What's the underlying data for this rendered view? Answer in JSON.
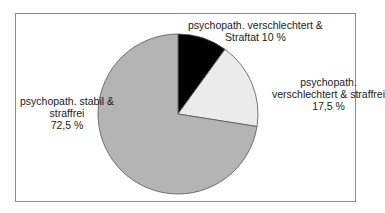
{
  "chart_data": {
    "type": "pie",
    "title": "",
    "start_angle_deg": 0,
    "direction": "clockwise",
    "slices": [
      {
        "label": "psychopath. verschlechtert & Straftat",
        "value": 10,
        "value_label": "10 %",
        "color": "#000000"
      },
      {
        "label": "psychopath. verschlechtert & straffrei",
        "value": 17.5,
        "value_label": "17,5 %",
        "color": "#ebebeb"
      },
      {
        "label": "psychopath. stabil & straffrei",
        "value": 72.5,
        "value_label": "72,5 %",
        "color": "#b4b4b4"
      }
    ],
    "legend": "none",
    "data_labels": "outside"
  },
  "labels": {
    "black": {
      "line1": "psychopath. verschlechtert &",
      "line2": "Straftat 10 %"
    },
    "light": {
      "line1": "psychopath.",
      "line2": "verschlechtert & straffrei",
      "line3": "17,5 %"
    },
    "gray": {
      "line1": "psychopath. stabil &",
      "line2": "straffrei",
      "line3": "72,5 %"
    }
  }
}
